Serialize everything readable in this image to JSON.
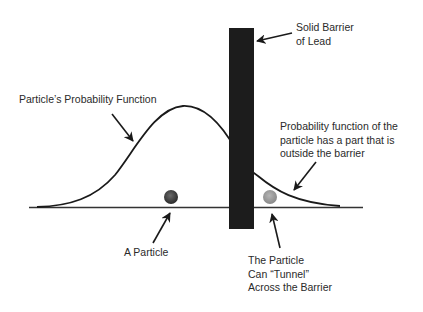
{
  "diagram": {
    "labels": {
      "barrier": [
        "Solid Barrier",
        "of Lead"
      ],
      "probability_function": "Particle’s Probability Function",
      "outside_part": [
        "Probability function of the",
        "particle has a part that is",
        "outside the barrier"
      ],
      "particle": "A Particle",
      "tunnel": [
        "The Particle",
        "Can “Tunnel”",
        "Across the Barrier"
      ]
    },
    "colors": {
      "barrier": "#1c1c1c",
      "curve": "#1a1a1a",
      "baseline": "#333333",
      "particle_left": "#3a3a3a",
      "particle_right": "#9a9a9a",
      "text": "#2a2a2a"
    }
  }
}
